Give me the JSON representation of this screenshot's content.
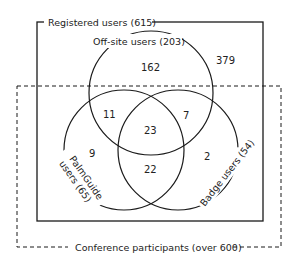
{
  "diagram": {
    "type": "venn",
    "outer_sets": {
      "registered": {
        "label": "Registered users (615)",
        "style": "solid"
      },
      "conference": {
        "label": "Conference participants (over 600)",
        "style": "dashed"
      }
    },
    "circles": {
      "offsite": {
        "label": "Off-site users (203)"
      },
      "palmguide_line1": "PalmGuide",
      "palmguide_line2": "users (65)",
      "badge": {
        "label": "Badge users (54)"
      }
    },
    "regions": {
      "registered_only": "379",
      "offsite_only": "162",
      "offsite_palmguide": "11",
      "offsite_badge": "7",
      "all_three": "23",
      "palmguide_only": "9",
      "palmguide_badge": "22",
      "badge_only": "2"
    },
    "colors": {
      "line": "#1a1a1a",
      "text": "#222222",
      "background": "#ffffff"
    }
  }
}
